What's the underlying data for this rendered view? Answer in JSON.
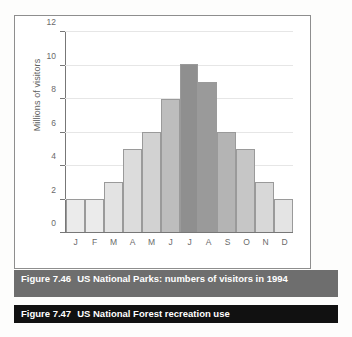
{
  "figure_46": {
    "caption_number": "Figure 7.46",
    "caption_text": "US National Parks: numbers of visitors  in 1994"
  },
  "figure_47": {
    "caption_number": "Figure 7.47",
    "caption_text": "US National Forest recreation use"
  },
  "colors": {
    "caption_1_bar": "#6e6e6e",
    "caption_2_bar": "#111111",
    "panel_border": "#8e8e8e",
    "axis": "#777777",
    "gridline": "#e6e6e6",
    "bar_border": "#9a9a9a"
  },
  "chart_data": {
    "type": "bar",
    "title": "US National Parks: numbers of visitors  in 1994",
    "xlabel": "",
    "ylabel": "Millions of visitors",
    "categories": [
      "J",
      "F",
      "M",
      "A",
      "M",
      "J",
      "J",
      "A",
      "S",
      "O",
      "N",
      "D"
    ],
    "values": [
      2,
      2,
      3,
      5,
      6,
      8,
      10.1,
      9,
      6,
      5,
      3,
      2
    ],
    "ylim": [
      0,
      12
    ],
    "yticks": [
      0,
      2,
      4,
      6,
      8,
      10,
      12
    ],
    "ytick_labels": [
      "0",
      "2",
      "4",
      "6",
      "8",
      "10",
      "12"
    ],
    "grid": true,
    "legend": "none",
    "bar_fills": [
      "#ebebeb",
      "#ebebeb",
      "#e3e3e3",
      "#dcdcdc",
      "#d2d2d2",
      "#bdbdbd",
      "#8f8f8f",
      "#9a9a9a",
      "#b4b4b4",
      "#c6c6c6",
      "#d8d8d8",
      "#e4e4e4"
    ]
  }
}
